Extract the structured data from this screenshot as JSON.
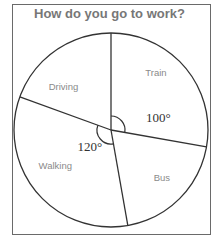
{
  "chart_data": {
    "type": "pie",
    "title": "How do you go to work?",
    "categories": [
      "Train",
      "Bus",
      "Walking",
      "Driving"
    ],
    "values_degrees": [
      100,
      70,
      120,
      70
    ],
    "angle_annotations": [
      {
        "category": "Train",
        "text": "100°"
      },
      {
        "category": "Walking",
        "text": "120°"
      }
    ],
    "colors": {
      "stroke": "#333333",
      "fill": "#ffffff",
      "label": "#8a8a8a"
    }
  }
}
